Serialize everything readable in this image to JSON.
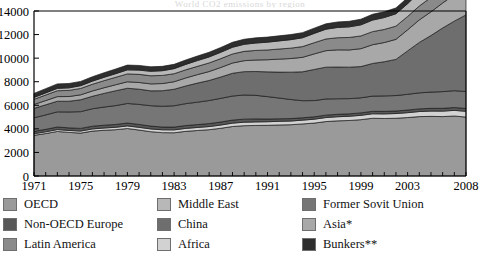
{
  "chart_title": "World CO2 emissions by region",
  "axis": {
    "y_ticks": [
      "0",
      "2000",
      "4000",
      "6000",
      "8000",
      "10000",
      "12000",
      "14000"
    ],
    "x_ticks": [
      "1971",
      "1975",
      "1979",
      "1983",
      "1987",
      "1991",
      "1995",
      "1999",
      "2003",
      "2008"
    ]
  },
  "legend": {
    "col1": [
      {
        "label": "OECD",
        "color": "#9a9a9a"
      },
      {
        "label": "Non-OECD Europe",
        "color": "#585858"
      },
      {
        "label": "Latin America",
        "color": "#8a8a8a"
      }
    ],
    "col2": [
      {
        "label": "Middle East",
        "color": "#b8b8b8"
      },
      {
        "label": "China",
        "color": "#6e6e6e"
      },
      {
        "label": "Africa",
        "color": "#d2d2d2"
      }
    ],
    "col3": [
      {
        "label": "Former Sovit Union",
        "color": "#767676"
      },
      {
        "label": "Asia*",
        "color": "#a8a8a8"
      },
      {
        "label": "Bunkers**",
        "color": "#2e2e2e"
      }
    ]
  },
  "chart_data": {
    "type": "area",
    "title": "World CO2 emissions by region",
    "xlabel": "",
    "ylabel": "",
    "ylim": [
      0,
      14000
    ],
    "xlim": [
      1971,
      2008
    ],
    "grid": false,
    "legend_position": "bottom",
    "stacked": true,
    "x": [
      1971,
      1972,
      1973,
      1974,
      1975,
      1976,
      1977,
      1978,
      1979,
      1980,
      1981,
      1982,
      1983,
      1984,
      1985,
      1986,
      1987,
      1988,
      1989,
      1990,
      1991,
      1992,
      1993,
      1994,
      1995,
      1996,
      1997,
      1998,
      1999,
      2000,
      2001,
      2002,
      2003,
      2004,
      2005,
      2006,
      2007,
      2008
    ],
    "series": [
      {
        "name": "OECD",
        "color": "#9a9a9a",
        "values": [
          3450,
          3600,
          3780,
          3700,
          3640,
          3810,
          3880,
          3930,
          4030,
          3900,
          3760,
          3680,
          3670,
          3790,
          3860,
          3930,
          4050,
          4200,
          4270,
          4290,
          4300,
          4330,
          4350,
          4420,
          4490,
          4620,
          4680,
          4710,
          4780,
          4900,
          4880,
          4900,
          4960,
          5040,
          5060,
          5040,
          5090,
          5000
        ]
      },
      {
        "name": "Africa",
        "color": "#d2d2d2",
        "values": [
          140,
          150,
          160,
          165,
          175,
          185,
          195,
          205,
          220,
          230,
          235,
          240,
          245,
          250,
          260,
          265,
          275,
          285,
          295,
          300,
          305,
          310,
          315,
          320,
          330,
          340,
          350,
          360,
          370,
          380,
          390,
          400,
          415,
          430,
          450,
          465,
          480,
          490
        ]
      },
      {
        "name": "Non-OECD Europe",
        "color": "#585858",
        "values": [
          200,
          210,
          215,
          220,
          225,
          230,
          235,
          240,
          245,
          245,
          240,
          235,
          235,
          240,
          245,
          250,
          255,
          260,
          260,
          255,
          230,
          215,
          205,
          200,
          200,
          205,
          205,
          205,
          205,
          210,
          215,
          215,
          220,
          225,
          230,
          235,
          240,
          240
        ]
      },
      {
        "name": "Former Sovit Union",
        "color": "#767676",
        "values": [
          1150,
          1220,
          1290,
          1350,
          1420,
          1480,
          1540,
          1600,
          1660,
          1700,
          1730,
          1760,
          1810,
          1860,
          1900,
          1960,
          2010,
          2040,
          2050,
          2000,
          1900,
          1760,
          1620,
          1450,
          1380,
          1370,
          1320,
          1290,
          1280,
          1290,
          1310,
          1310,
          1340,
          1360,
          1380,
          1420,
          1430,
          1440
        ]
      },
      {
        "name": "China",
        "color": "#6e6e6e",
        "values": [
          800,
          860,
          900,
          910,
          1010,
          1060,
          1160,
          1260,
          1290,
          1290,
          1260,
          1320,
          1400,
          1500,
          1620,
          1700,
          1810,
          1930,
          1980,
          2020,
          2100,
          2200,
          2320,
          2450,
          2640,
          2700,
          2690,
          2670,
          2650,
          2770,
          2900,
          3070,
          3680,
          4280,
          4800,
          5400,
          5900,
          6500
        ]
      },
      {
        "name": "Asia*",
        "color": "#a8a8a8",
        "values": [
          330,
          360,
          390,
          400,
          420,
          450,
          480,
          510,
          550,
          570,
          590,
          610,
          640,
          680,
          720,
          760,
          810,
          870,
          930,
          980,
          1030,
          1100,
          1160,
          1230,
          1320,
          1400,
          1460,
          1460,
          1520,
          1590,
          1630,
          1700,
          1790,
          1910,
          2010,
          2120,
          2240,
          2330
        ]
      },
      {
        "name": "Latin America",
        "color": "#8a8a8a",
        "values": [
          440,
          470,
          500,
          520,
          540,
          570,
          600,
          630,
          670,
          690,
          690,
          690,
          680,
          690,
          700,
          730,
          750,
          770,
          790,
          810,
          830,
          860,
          880,
          910,
          950,
          990,
          1030,
          1060,
          1080,
          1110,
          1110,
          1120,
          1130,
          1180,
          1220,
          1260,
          1300,
          1340
        ]
      },
      {
        "name": "Middle East",
        "color": "#b8b8b8",
        "values": [
          160,
          180,
          200,
          215,
          235,
          260,
          285,
          310,
          340,
          360,
          380,
          400,
          430,
          460,
          490,
          510,
          540,
          570,
          600,
          630,
          660,
          690,
          720,
          750,
          790,
          830,
          870,
          900,
          940,
          980,
          1010,
          1050,
          1090,
          1160,
          1220,
          1280,
          1340,
          1400
        ]
      },
      {
        "name": "Bunkers**",
        "color": "#2e2e2e",
        "values": [
          340,
          360,
          380,
          370,
          360,
          375,
          385,
          395,
          405,
          395,
          380,
          370,
          365,
          375,
          385,
          395,
          405,
          420,
          430,
          435,
          430,
          430,
          430,
          435,
          445,
          455,
          465,
          470,
          480,
          495,
          490,
          495,
          505,
          525,
          545,
          565,
          585,
          600
        ]
      }
    ]
  }
}
